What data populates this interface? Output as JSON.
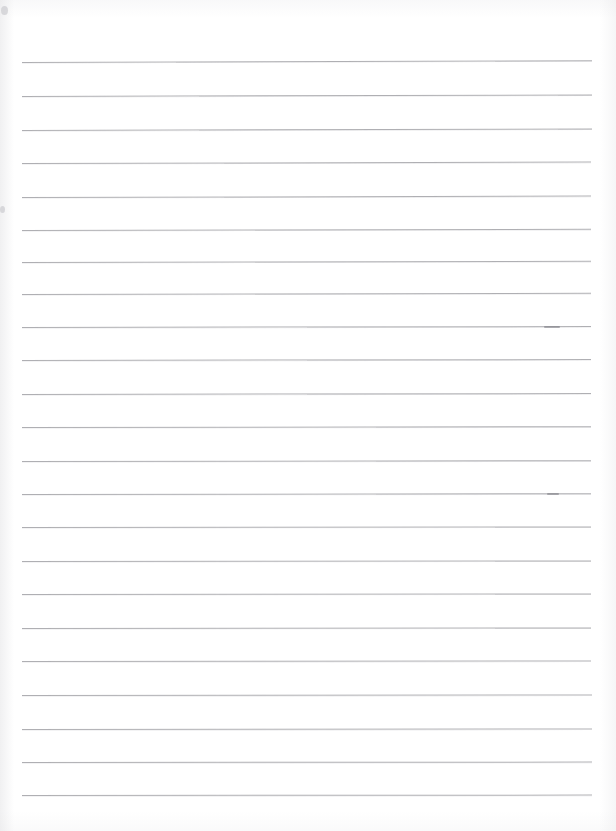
{
  "document": {
    "kind": "lined-notebook-paper-scan",
    "title": "Blank lined paper",
    "content_text": "",
    "page_width": 616,
    "page_height": 831,
    "background_color": "#ffffff",
    "rule_color": "#a9a9ad",
    "rule_thickness_px": 1.5,
    "rule_count": 23,
    "rule_spacing_px": 33.4,
    "left_margin_px": 22,
    "right_margin_px": 592,
    "first_rule_y_px": 62,
    "last_rule_y_px": 795,
    "has_vertical_margin_rule": false,
    "has_handwriting": false,
    "has_printed_text": false
  },
  "rules": [
    {
      "y": 62,
      "x1": 22,
      "x2": 592,
      "tilt": -0.18
    },
    {
      "y": 96,
      "x1": 22,
      "x2": 592,
      "tilt": -0.16
    },
    {
      "y": 130,
      "x1": 22,
      "x2": 592,
      "tilt": -0.16
    },
    {
      "y": 163,
      "x1": 22,
      "x2": 591,
      "tilt": -0.14
    },
    {
      "y": 197,
      "x1": 22,
      "x2": 591,
      "tilt": -0.14
    },
    {
      "y": 230,
      "x1": 22,
      "x2": 591,
      "tilt": -0.12
    },
    {
      "y": 262,
      "x1": 22,
      "x2": 591,
      "tilt": -0.12
    },
    {
      "y": 294,
      "x1": 22,
      "x2": 591,
      "tilt": -0.12
    },
    {
      "y": 327,
      "x1": 22,
      "x2": 591,
      "tilt": -0.1
    },
    {
      "y": 360,
      "x1": 22,
      "x2": 591,
      "tilt": -0.1
    },
    {
      "y": 394,
      "x1": 22,
      "x2": 591,
      "tilt": -0.1
    },
    {
      "y": 427,
      "x1": 22,
      "x2": 591,
      "tilt": -0.08
    },
    {
      "y": 461,
      "x1": 22,
      "x2": 591,
      "tilt": -0.08
    },
    {
      "y": 494,
      "x1": 22,
      "x2": 591,
      "tilt": -0.08
    },
    {
      "y": 527,
      "x1": 22,
      "x2": 591,
      "tilt": -0.06
    },
    {
      "y": 561,
      "x1": 22,
      "x2": 591,
      "tilt": -0.06
    },
    {
      "y": 594,
      "x1": 22,
      "x2": 591,
      "tilt": -0.06
    },
    {
      "y": 628,
      "x1": 22,
      "x2": 591,
      "tilt": -0.06
    },
    {
      "y": 661,
      "x1": 22,
      "x2": 591,
      "tilt": -0.05
    },
    {
      "y": 695,
      "x1": 22,
      "x2": 592,
      "tilt": -0.05
    },
    {
      "y": 729,
      "x1": 22,
      "x2": 592,
      "tilt": -0.05
    },
    {
      "y": 762,
      "x1": 22,
      "x2": 592,
      "tilt": -0.04
    },
    {
      "y": 795,
      "x1": 22,
      "x2": 592,
      "tilt": -0.04
    }
  ],
  "marks": [
    {
      "name": "smudge-upper-right",
      "x": 544,
      "y": 326,
      "w": 16,
      "h": 1.6
    },
    {
      "name": "smudge-mid-right",
      "x": 547,
      "y": 493,
      "w": 12,
      "h": 1.6
    },
    {
      "name": "fleck-top-left",
      "x": 1,
      "y": 6,
      "w": 7,
      "h": 9
    },
    {
      "name": "fleck-mid-left",
      "x": 0,
      "y": 206,
      "w": 5,
      "h": 7
    }
  ]
}
